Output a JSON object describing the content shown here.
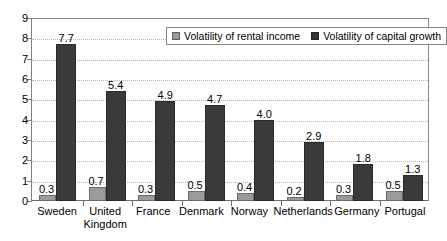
{
  "chart_data": {
    "type": "bar",
    "title": "",
    "subtitle": "",
    "xlabel": "",
    "ylabel": "",
    "ylim": [
      0,
      9
    ],
    "y_ticks": [
      0,
      1,
      2,
      3,
      4,
      5,
      6,
      7,
      8,
      9
    ],
    "grid": true,
    "legend_position": "top-center-inside",
    "categories": [
      "Sweden",
      "United Kingdom",
      "France",
      "Denmark",
      "Norway",
      "Netherlands",
      "Germany",
      "Portugal"
    ],
    "series": [
      {
        "name": "Volatility of rental income",
        "color": "#9a9a9a",
        "values": [
          0.3,
          0.7,
          0.3,
          0.5,
          0.4,
          0.2,
          0.3,
          0.5
        ],
        "labels": [
          "0.3",
          "0.7",
          "0.3",
          "0.5",
          "0.4",
          "0.2",
          "0.3",
          "0.5"
        ]
      },
      {
        "name": "Volatility of capital growth",
        "color": "#3a3a3a",
        "values": [
          7.7,
          5.4,
          4.9,
          4.7,
          4.0,
          2.9,
          1.8,
          1.3
        ],
        "labels": [
          "7.7",
          "5.4",
          "4.9",
          "4.7",
          "4.0",
          "2.9",
          "1.8",
          "1.3"
        ]
      }
    ]
  },
  "axis": {
    "y_tick_labels": [
      "9",
      "8",
      "7",
      "6",
      "5",
      "4",
      "3",
      "2",
      "1",
      "0"
    ]
  },
  "legend": {
    "items": [
      {
        "label": "Volatility of rental income",
        "swatch": "light-gray-square-icon"
      },
      {
        "label": "Volatility of capital growth",
        "swatch": "dark-gray-square-icon"
      }
    ]
  }
}
